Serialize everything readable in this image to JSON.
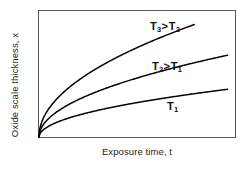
{
  "figure": {
    "background_color": "#ffffff",
    "line_color": "#000000",
    "frame_color": "#4a4a4a"
  },
  "axes": {
    "ylabel": "Oxide scale thickness, x",
    "xlabel": "Exposure time, t"
  },
  "labels": {
    "t3": {
      "base": "T",
      "sub": "3",
      "relation": ">",
      "base2": "T",
      "sub2": "2"
    },
    "t2": {
      "base": "T",
      "sub": "2",
      "relation": ">",
      "base2": "T",
      "sub2": "1"
    },
    "t1": {
      "base": "T",
      "sub": "1",
      "relation": "",
      "base2": "",
      "sub2": ""
    }
  },
  "chart_data": {
    "type": "line",
    "title": "",
    "subtitle": "",
    "xlabel": "Exposure time, t",
    "ylabel": "Oxide scale thickness, x",
    "xlim": [
      0,
      1
    ],
    "ylim": [
      0,
      1
    ],
    "grid": false,
    "axis_ticks": false,
    "legend": "inline-annotations",
    "annotations": [
      {
        "text": "T3 > T2",
        "x": 0.57,
        "y": 0.78
      },
      {
        "text": "T2 > T1",
        "x": 0.58,
        "y": 0.47
      },
      {
        "text": "T1",
        "x": 0.66,
        "y": 0.18
      }
    ],
    "series": [
      {
        "name": "T3",
        "label": "T3 > T2",
        "color": "#000000",
        "rate_constant": 1.0,
        "x": [
          0.0,
          0.01,
          0.03,
          0.06,
          0.1,
          0.15,
          0.21,
          0.28,
          0.36,
          0.45,
          0.55,
          0.66,
          0.79
        ],
        "y": [
          0.0,
          0.1,
          0.17,
          0.245,
          0.316,
          0.387,
          0.458,
          0.529,
          0.6,
          0.671,
          0.742,
          0.812,
          1.0
        ]
      },
      {
        "name": "T2",
        "label": "T2 > T1",
        "color": "#000000",
        "rate_constant": 0.66,
        "x": [
          0.0,
          0.01,
          0.03,
          0.07,
          0.13,
          0.2,
          0.29,
          0.4,
          0.52,
          0.66,
          0.81,
          0.96
        ],
        "y": [
          0.0,
          0.066,
          0.114,
          0.175,
          0.238,
          0.295,
          0.355,
          0.417,
          0.476,
          0.536,
          0.594,
          0.647
        ]
      },
      {
        "name": "T1",
        "label": "T1",
        "color": "#000000",
        "rate_constant": 0.385,
        "x": [
          0.0,
          0.01,
          0.03,
          0.07,
          0.13,
          0.21,
          0.31,
          0.43,
          0.56,
          0.71,
          0.87,
          0.96
        ],
        "y": [
          0.0,
          0.0385,
          0.0667,
          0.102,
          0.139,
          0.176,
          0.214,
          0.252,
          0.288,
          0.324,
          0.359,
          0.377
        ]
      }
    ]
  }
}
